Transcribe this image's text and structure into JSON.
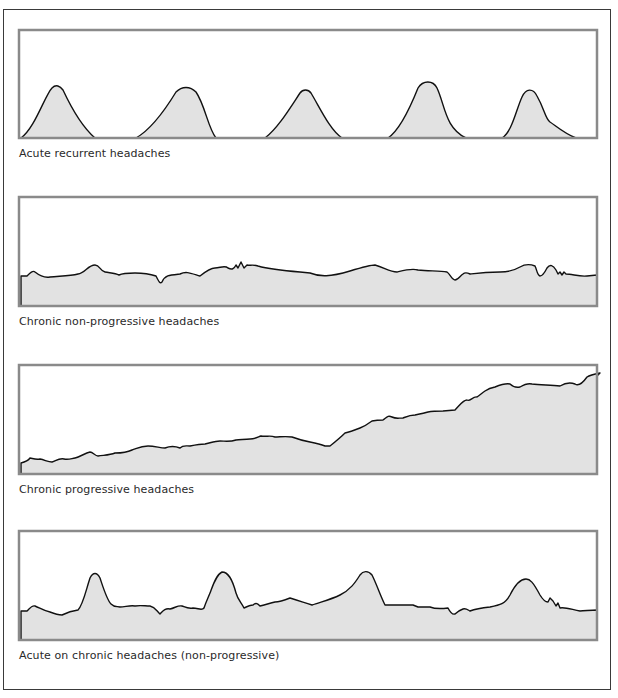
{
  "figure": {
    "panels": [
      {
        "caption": "Acute recurrent headaches",
        "pattern": "acute-recurrent",
        "box": {
          "x": 19,
          "y": 30,
          "w": 578,
          "h": 108
        },
        "path": "M21,138 C35,128 45,95 52,88 C56,84 60,86 63,90 C70,105 80,125 95,138 L136,138 C150,130 165,110 176,92 C182,86 190,86 196,92 C205,105 208,128 216,138 L265,138 C278,128 290,108 300,93 C303,89 308,89 311,93 C320,108 330,130 342,138 L388,138 C400,130 410,108 418,88 C423,80 433,80 437,88 C445,105 445,128 466,138 L502,138 C512,132 516,110 522,97 C526,88 533,88 537,96 C545,110 545,118 550,122 C556,126 565,134 576,138 Z",
        "caption_y": 158
      },
      {
        "caption": "Chronic non-progressive headaches",
        "pattern": "chronic-non-progressive",
        "box": {
          "x": 19,
          "y": 197,
          "w": 578,
          "h": 109
        },
        "path": "M21,276 L27,276 C30,273 33,270 35,272 C40,276 45,278 50,277 C60,276 70,276 78,274 C85,273 88,265 95,265 C100,265 100,271 105,272 C110,273 115,273 119,275 C123,273 128,273 135,273 C145,273 150,274 156,276 C159,282 160,284 162,282 C165,275 170,275 180,274 C186,271 190,273 200,276 C205,272 210,268 215,268 C220,268 225,265 228,268 C232,270 234,269 236,265 L238,268 L241,262 L244,268 L247,265 C250,266 252,264 258,266 C265,268 275,270 300,272 L310,273 C320,277 330,277 350,271 C360,268 370,265 375,265 C385,268 390,272 397,272 C405,270 412,268 418,270 C430,271 440,271 447,272 C450,274 452,280 455,280 C458,280 460,276 463,274 C465,272 468,273 470,274 C478,273 485,272 500,272 C510,272 515,270 520,267 C525,264 530,264 535,266 C537,270 537,275 540,276 C543,276 545,272 547,268 C550,264 553,265 556,270 L558,274 L560,272 L562,275 L564,272 L566,274 C572,274 580,277 587,276 L597,275 L597,306 L21,306 Z",
        "caption_y": 326
      },
      {
        "caption": "Chronic progressive headaches",
        "pattern": "chronic-progressive",
        "box": {
          "x": 19,
          "y": 365,
          "w": 578,
          "h": 109
        },
        "path": "M21,463 C25,462 28,461 30,458 C32,458 35,460 40,459 C45,460 48,462 52,462 C57,460 60,458 64,459 C68,460 70,459 75,458 C80,457 85,453 90,452 C93,452 95,456 98,456 C105,455 110,455 115,453 C122,453 128,452 132,450 C136,449 140,446 148,446 C155,446 160,448 165,448 C170,446 175,446 180,448 C183,445 185,446 190,446 C195,445 200,444 205,444 C210,443 215,441 220,441 C225,441 230,442 236,440 C240,440 245,439 250,439 C255,439 258,437 261,436 C267,437 270,435 275,437 C280,437 285,436 292,437 C300,440 305,441 310,442 C315,443 320,444 325,446 L330,446 C335,442 340,438 345,433 C350,432 355,430 360,428 C365,426 368,424 372,421 C377,420 380,420 383,420 C387,417 388,415 392,417 C396,419 398,418 403,418 C408,416 410,415 415,415 C420,414 425,413 428,412 C433,411 438,411 443,411 L455,410 C460,405 463,400 467,400 C470,402 473,396 477,397 C480,395 482,393 485,391 C488,389 490,388 495,387 C500,385 505,383 510,384 C512,386 515,388 520,387 C525,384 528,383 532,384 C540,385 550,385 560,386 C565,383 570,382 575,384 C578,386 582,384 587,377 C590,375 595,374 600,373 L597,376 L597,474 L21,474 Z",
        "caption_y": 494
      },
      {
        "caption": "Acute on chronic headaches (non-progressive)",
        "pattern": "acute-on-chronic",
        "box": {
          "x": 19,
          "y": 531,
          "w": 578,
          "h": 109
        },
        "path": "M21,611 L27,611 C30,608 32,605 35,606 C40,608 44,611 50,612 C55,614 58,615 62,615 C66,613 70,611 78,610 C83,605 86,590 90,578 C93,572 97,572 100,578 C104,590 107,600 111,604 C115,608 117,606 120,607 C125,607 130,605 135,606 C140,605 145,606 150,606 C155,607 156,610 160,614 C163,611 165,608 170,609 C175,608 178,605 182,606 C185,607 188,609 193,608 C198,608 202,611 204,608 C206,602 208,598 210,593 C213,585 216,575 222,572 C228,572 232,578 236,593 C238,600 241,602 244,608 C248,606 250,605 253,605 C256,602 258,604 260,606 C265,605 270,603 275,602 C280,602 285,600 290,598 C300,601 305,603 312,605 C320,602 330,600 340,595 C350,590 355,583 360,575 C363,571 368,570 372,575 C377,585 380,595 385,605 L413,605 L418,607 L430,607 C435,609 440,609 448,608 C450,612 452,615 455,614 C457,612 460,610 463,609 C466,608 468,610 470,611 C475,609 480,608 490,607 C500,605 505,604 510,595 C515,585 520,579 526,579 C530,579 533,582 540,595 C543,600 546,602 548,602 L550,598 L553,601 L556,606 L558,603 L560,608 C565,607 570,609 580,611 C585,611 590,610 597,610 L597,640 L21,640 Z",
        "caption_y": 660
      }
    ],
    "colors": {
      "outer_border": "#3a3a3a",
      "panel_border": "#8a8a8a",
      "fill": "#e2e2e2",
      "line": "#111111",
      "caption": "#2a2a2a"
    }
  }
}
